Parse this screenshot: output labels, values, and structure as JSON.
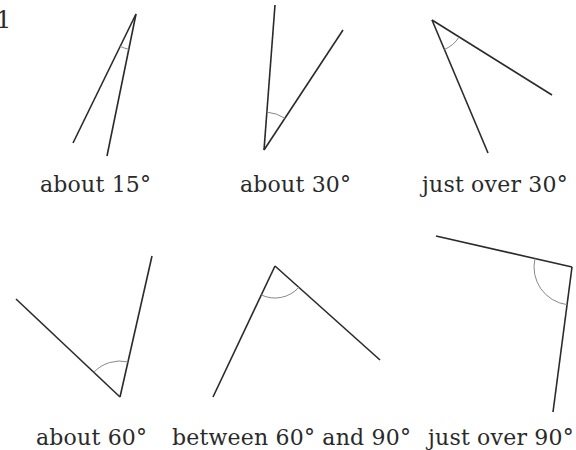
{
  "question_number": "1",
  "angles": [
    {
      "label": "about 15°",
      "apex": [
        136,
        14
      ],
      "arm1": [
        73,
        143
      ],
      "arm2": [
        107,
        156
      ],
      "arc_r": 36,
      "label_pos": [
        40,
        172
      ]
    },
    {
      "label": "about 30°",
      "apex": [
        264,
        150
      ],
      "arm1": [
        275,
        5
      ],
      "arm2": [
        343,
        30
      ],
      "arc_r": 38,
      "label_pos": [
        240,
        172
      ]
    },
    {
      "label": "just over 30°",
      "apex": [
        432,
        20
      ],
      "arm1": [
        552,
        95
      ],
      "arm2": [
        488,
        153
      ],
      "arc_r": 32,
      "label_pos": [
        422,
        172
      ]
    },
    {
      "label": "about 60°",
      "apex": [
        120,
        397
      ],
      "arm1": [
        16,
        299
      ],
      "arm2": [
        152,
        256
      ],
      "arc_r": 36,
      "label_pos": [
        36,
        425
      ]
    },
    {
      "label": "between 60° and 90°",
      "apex": [
        275,
        266
      ],
      "arm1": [
        213,
        397
      ],
      "arm2": [
        380,
        360
      ],
      "arc_r": 32,
      "label_pos": [
        172,
        425
      ]
    },
    {
      "label": "just over 90°",
      "apex": [
        572,
        267
      ],
      "arm1": [
        436,
        236
      ],
      "arm2": [
        553,
        412
      ],
      "arc_r": 38,
      "label_pos": [
        428,
        425
      ]
    }
  ]
}
